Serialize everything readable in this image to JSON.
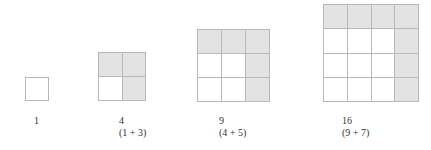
{
  "figure": {
    "colors": {
      "shaded": "#e3e3e3",
      "border": "#b8b8b8",
      "background": "#ffffff"
    },
    "squares": [
      {
        "n": 1,
        "value": "1",
        "sum": ""
      },
      {
        "n": 2,
        "value": "4",
        "sum": "(1 + 3)"
      },
      {
        "n": 3,
        "value": "9",
        "sum": "(4 + 5)"
      },
      {
        "n": 4,
        "value": "16",
        "sum": "(9 + 7)"
      }
    ]
  }
}
